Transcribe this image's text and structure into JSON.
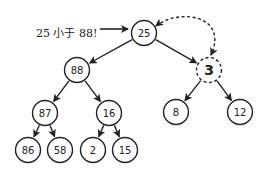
{
  "diagram": {
    "title": "",
    "annotation": {
      "text": "25 小于 88!",
      "x": 58,
      "y": 37
    },
    "colors": {
      "stroke": "#222222",
      "background": "#ffffff",
      "text": "#222222"
    },
    "nodes": [
      {
        "id": "n25",
        "label": "25",
        "x": 144,
        "y": 33,
        "style": "solid"
      },
      {
        "id": "n88",
        "label": "88",
        "x": 77,
        "y": 70,
        "style": "solid"
      },
      {
        "id": "n3",
        "label": "3",
        "x": 209,
        "y": 70,
        "style": "dashed"
      },
      {
        "id": "n87",
        "label": "87",
        "x": 45,
        "y": 113,
        "style": "solid"
      },
      {
        "id": "n16",
        "label": "16",
        "x": 109,
        "y": 113,
        "style": "solid"
      },
      {
        "id": "n8",
        "label": "8",
        "x": 176,
        "y": 112,
        "style": "solid"
      },
      {
        "id": "n12",
        "label": "12",
        "x": 240,
        "y": 112,
        "style": "solid"
      },
      {
        "id": "n86",
        "label": "86",
        "x": 28,
        "y": 150,
        "style": "solid"
      },
      {
        "id": "n58",
        "label": "58",
        "x": 60,
        "y": 150,
        "style": "solid"
      },
      {
        "id": "n2",
        "label": "2",
        "x": 93,
        "y": 150,
        "style": "solid"
      },
      {
        "id": "n15",
        "label": "15",
        "x": 125,
        "y": 150,
        "style": "solid"
      }
    ],
    "edges": [
      {
        "from": "n25",
        "to": "n88"
      },
      {
        "from": "n25",
        "to": "n3"
      },
      {
        "from": "n88",
        "to": "n87"
      },
      {
        "from": "n88",
        "to": "n16"
      },
      {
        "from": "n3",
        "to": "n8"
      },
      {
        "from": "n3",
        "to": "n12"
      },
      {
        "from": "n87",
        "to": "n86"
      },
      {
        "from": "n87",
        "to": "n58"
      },
      {
        "from": "n16",
        "to": "n2"
      },
      {
        "from": "n16",
        "to": "n15"
      }
    ],
    "swap_arrow": {
      "from": "n25",
      "to": "n3",
      "style": "dashed",
      "bidirectional": true
    },
    "annotation_arrow": {
      "from_x": 100,
      "from_y": 33,
      "to_x": 128,
      "to_y": 33
    }
  }
}
